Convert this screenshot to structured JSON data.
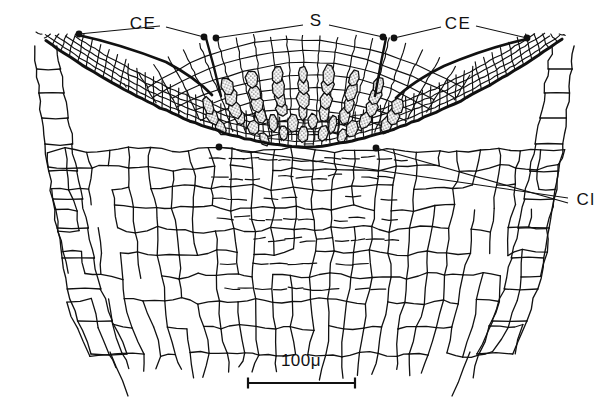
{
  "figure": {
    "type": "scientific-line-drawing",
    "background_color": "#ffffff",
    "ink_color": "#111111",
    "stipple_fill_color": "#d9d9d9",
    "width": 609,
    "height": 410
  },
  "labels": [
    {
      "id": "ce-left",
      "text": "CE",
      "x": 143,
      "y": 25,
      "leaders": [
        {
          "from_x": 160,
          "from_y": 26,
          "to_x": 79,
          "to_y": 34
        },
        {
          "from_x": 166,
          "from_y": 27,
          "to_x": 204,
          "to_y": 37
        }
      ],
      "dots": [
        {
          "x": 79,
          "y": 34
        },
        {
          "x": 204,
          "y": 37
        }
      ]
    },
    {
      "id": "s-center",
      "text": "S",
      "x": 316,
      "y": 22,
      "leaders": [
        {
          "from_x": 303,
          "from_y": 25,
          "to_x": 216,
          "to_y": 38
        },
        {
          "from_x": 329,
          "from_y": 25,
          "to_x": 383,
          "to_y": 37
        }
      ],
      "dots": [
        {
          "x": 216,
          "y": 38
        },
        {
          "x": 383,
          "y": 37
        }
      ]
    },
    {
      "id": "ce-right",
      "text": "CE",
      "x": 458,
      "y": 25,
      "leaders": [
        {
          "from_x": 441,
          "from_y": 27,
          "to_x": 394,
          "to_y": 38
        },
        {
          "from_x": 476,
          "from_y": 26,
          "to_x": 527,
          "to_y": 38
        }
      ],
      "dots": [
        {
          "x": 394,
          "y": 38
        },
        {
          "x": 527,
          "y": 38
        }
      ]
    },
    {
      "id": "cl-right",
      "text": "Cl",
      "x": 586,
      "y": 201,
      "leaders": [
        {
          "from_x": 568,
          "from_y": 198,
          "to_x": 219,
          "to_y": 147
        },
        {
          "from_x": 568,
          "from_y": 203,
          "to_x": 376,
          "to_y": 148
        }
      ],
      "dots": [
        {
          "x": 219,
          "y": 147
        },
        {
          "x": 376,
          "y": 148
        }
      ]
    }
  ],
  "scale_bar": {
    "text": "100μ",
    "text_x": 301,
    "text_y": 362,
    "bar_y": 383,
    "bar_x1": 248,
    "bar_x2": 355,
    "cap_height": 11
  }
}
